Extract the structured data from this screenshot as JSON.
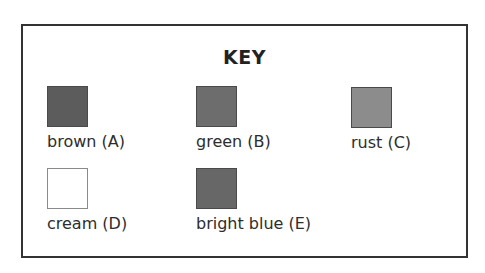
{
  "key": {
    "title": "KEY",
    "items": [
      {
        "id": "A",
        "label": "brown (A)",
        "swatch_color": "#5c5c5c",
        "row": 1,
        "col": 1
      },
      {
        "id": "B",
        "label": "green (B)",
        "swatch_color": "#6d6d6d",
        "row": 1,
        "col": 2
      },
      {
        "id": "C",
        "label": "rust (C)",
        "swatch_color": "#8c8c8c",
        "row": 1,
        "col": 3
      },
      {
        "id": "D",
        "label": "cream (D)",
        "swatch_color": "#ffffff",
        "row": 2,
        "col": 1
      },
      {
        "id": "E",
        "label": "bright blue (E)",
        "swatch_color": "#676767",
        "row": 2,
        "col": 2
      }
    ]
  }
}
